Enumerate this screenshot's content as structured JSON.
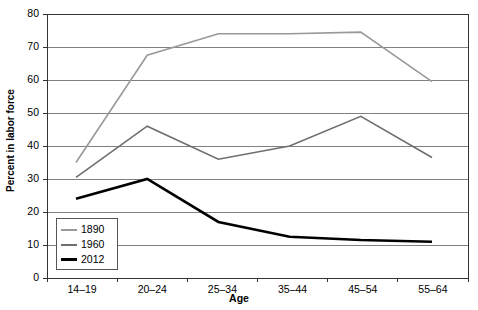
{
  "chart_data": {
    "type": "line",
    "title": "",
    "xlabel": "Age",
    "ylabel": "Percent in labor force",
    "categories": [
      "14–19",
      "20–24",
      "25–34",
      "35–44",
      "45–54",
      "55–64"
    ],
    "ylim": [
      0,
      80
    ],
    "ytick_values": [
      0,
      10,
      20,
      30,
      40,
      50,
      60,
      70,
      80
    ],
    "ytick_labels": [
      "0",
      "10",
      "20",
      "30",
      "40",
      "50",
      "60",
      "70",
      "80"
    ],
    "grid": true,
    "grid_axis": "y",
    "legend_position": "bottom-left-inside",
    "series": [
      {
        "name": "1890",
        "color": "#999999",
        "width": 1.6,
        "values": [
          35,
          67.5,
          74,
          74,
          74.5,
          59.5
        ]
      },
      {
        "name": "1960",
        "color": "#6e6e6e",
        "width": 1.6,
        "values": [
          30.5,
          46,
          36,
          40,
          49,
          36.5
        ]
      },
      {
        "name": "2012",
        "color": "#000000",
        "width": 2.6,
        "values": [
          24,
          30,
          17,
          12.5,
          11.5,
          11
        ]
      }
    ]
  },
  "legend": {
    "entries": [
      {
        "label": "1890",
        "color": "#999999",
        "width": 2
      },
      {
        "label": "1960",
        "color": "#6e6e6e",
        "width": 2
      },
      {
        "label": "2012",
        "color": "#000000",
        "width": 3
      }
    ]
  },
  "axes": {
    "frame_color": "#333333",
    "gridline_color": "#808080",
    "background": "#ffffff"
  }
}
